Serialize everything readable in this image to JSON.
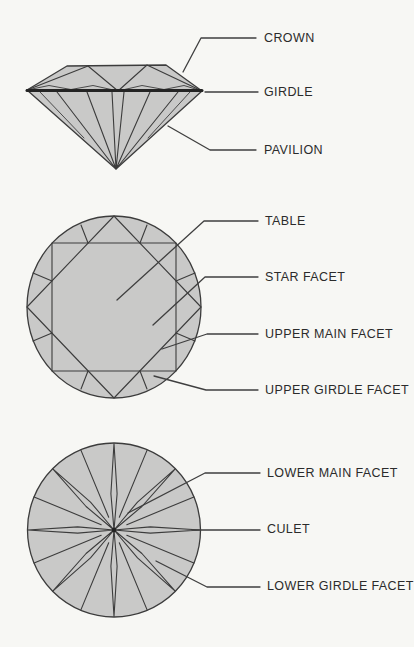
{
  "figure_type": "diamond-anatomy-diagram",
  "colors": {
    "background": "#f7f7f4",
    "shape_fill": "#c9c9c8",
    "line": "#3c3c3c",
    "text": "#2b2b2b"
  },
  "views": {
    "side_view": "profile of brilliant-cut diamond",
    "crown_view": "top (face-up) view of brilliant-cut diamond",
    "pavilion_view": "bottom (face-down) view of brilliant-cut diamond"
  },
  "labels": {
    "crown": "CROWN",
    "girdle": "GIRDLE",
    "pavilion": "PAVILION",
    "table": "TABLE",
    "star_facet": "STAR FACET",
    "upper_main_facet": "UPPER MAIN FACET",
    "upper_girdle_facet": "UPPER GIRDLE FACET",
    "lower_main_facet": "LOWER MAIN FACET",
    "culet": "CULET",
    "lower_girdle_facet": "LOWER GIRDLE FACET"
  }
}
